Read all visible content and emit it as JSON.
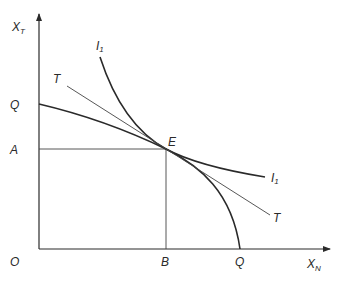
{
  "diagram": {
    "axes": {
      "y_label": "X",
      "y_label_sub": "T",
      "x_label": "X",
      "x_label_sub": "N",
      "origin_label": "O"
    },
    "points": {
      "equilibrium": "E",
      "y_intercept_ppf": "Q",
      "x_intercept_ppf": "Q",
      "y_projection": "A",
      "x_projection": "B"
    },
    "curves": {
      "indifference_label_top": "I",
      "indifference_label_top_sub": "1",
      "indifference_label_right": "I",
      "indifference_label_right_sub": "1",
      "tangent_label_left": "T",
      "tangent_label_right": "T"
    },
    "colors": {
      "line": "#2a2a2a",
      "background": "#ffffff"
    }
  }
}
